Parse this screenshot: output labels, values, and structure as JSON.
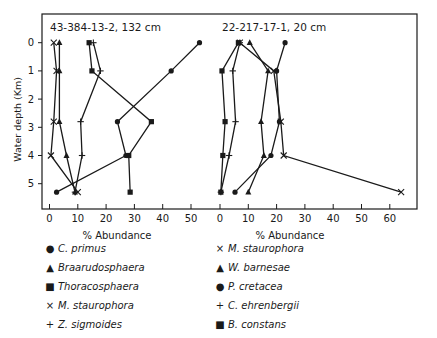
{
  "chart_data": {
    "type": "line",
    "ylabel": "Water depth (Km)",
    "yticks": [
      0,
      1,
      2,
      3,
      4,
      5
    ],
    "ylim": [
      5.9,
      -0.9
    ],
    "grid": false,
    "panels": [
      {
        "title": "43-384-13-2, 132 cm",
        "xlabel": "% Abundance",
        "xticks": [
          0,
          10,
          20,
          30,
          40,
          50
        ],
        "xlim": [
          -2.5,
          55.5
        ],
        "depths": [
          0,
          1,
          2.8,
          4,
          5.3
        ],
        "series": [
          {
            "name": "C. primus",
            "marker": "circle",
            "values": [
              53,
              43,
              24,
              27,
              2.5
            ]
          },
          {
            "name": "Braarudosphaera",
            "marker": "triangle",
            "values": [
              3.5,
              3.5,
              3.5,
              6,
              9
            ]
          },
          {
            "name": "Thoracosphaera",
            "marker": "square",
            "values": [
              14,
              15,
              36,
              28,
              28.5
            ]
          },
          {
            "name": "M. staurophora",
            "marker": "cross",
            "values": [
              1.5,
              2.5,
              1.5,
              0.5,
              10
            ]
          },
          {
            "name": "Z. sigmoides",
            "marker": "plus",
            "values": [
              15.5,
              18,
              11,
              11.5,
              9
            ]
          }
        ]
      },
      {
        "title": "22-217-17-1, 20 cm",
        "xlabel": "% Abundance",
        "xticks": [
          0,
          10,
          20,
          30,
          40,
          50,
          60
        ],
        "xlim": [
          -2.5,
          70
        ],
        "depths": [
          0,
          1,
          2.8,
          4,
          5.3
        ],
        "series": [
          {
            "name": "M. staurophora",
            "marker": "cross",
            "values": [
              7,
              19,
              21.5,
              22.5,
              64
            ]
          },
          {
            "name": "W. barnesae",
            "marker": "triangle",
            "values": [
              10.5,
              17,
              14.5,
              15.5,
              10
            ]
          },
          {
            "name": "P. cretacea",
            "marker": "circle",
            "values": [
              23,
              20,
              21,
              18,
              5.3
            ]
          },
          {
            "name": "C. ehrenbergii",
            "marker": "plus",
            "values": [
              7,
              4.5,
              5.5,
              3.2,
              0.3
            ]
          },
          {
            "name": "B. constans",
            "marker": "square",
            "values": [
              6.5,
              0.7,
              1.8,
              1,
              0.3
            ]
          }
        ]
      }
    ],
    "legend": {
      "left": [
        {
          "symbol": "●",
          "label": "C. primus"
        },
        {
          "symbol": "▲",
          "label": "Braarudosphaera"
        },
        {
          "symbol": "■",
          "label": "Thoracosphaera"
        },
        {
          "symbol": "×",
          "label": "M. staurophora"
        },
        {
          "symbol": "+",
          "label": "Z. sigmoides"
        }
      ],
      "right": [
        {
          "symbol": "×",
          "label": "M. staurophora"
        },
        {
          "symbol": "▲",
          "label": "W. barnesae"
        },
        {
          "symbol": "●",
          "label": "P. cretacea"
        },
        {
          "symbol": "+",
          "label": "C. ehrenbergii"
        },
        {
          "symbol": "■",
          "label": "B. constans"
        }
      ]
    }
  }
}
